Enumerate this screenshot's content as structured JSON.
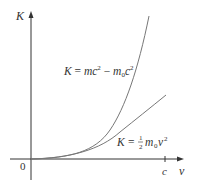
{
  "diagram": {
    "title": "",
    "axes": {
      "y_label": "K",
      "x_label": "v",
      "origin_label": "0",
      "x_tick_label": "c"
    },
    "curves": [
      {
        "name": "relativistic",
        "label_parts": {
          "lhs": "K",
          "eq": " = ",
          "t1": "mc",
          "t1_exp": "2",
          "minus": " − ",
          "t2": "m",
          "t2_sub": "0",
          "t3": "c",
          "t3_exp": "2"
        }
      },
      {
        "name": "classical",
        "label_parts": {
          "lhs": "K",
          "eq": " = ",
          "frac_num": "1",
          "frac_den": "2",
          "t1": "m",
          "t1_sub": "0",
          "t2": "v",
          "t2_exp": "2"
        }
      }
    ],
    "colors": {
      "axis": "#333333",
      "curve": "#777777",
      "text": "#333333"
    }
  }
}
